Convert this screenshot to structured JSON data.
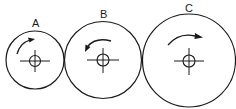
{
  "diagram": {
    "type": "gear-train",
    "gears": [
      {
        "id": "A",
        "label": "A",
        "cx": 35,
        "cy": 60,
        "r": 29,
        "rotation": "clockwise"
      },
      {
        "id": "B",
        "label": "B",
        "cx": 103,
        "cy": 60,
        "r": 39,
        "rotation": "counterclockwise"
      },
      {
        "id": "C",
        "label": "C",
        "cx": 189,
        "cy": 60,
        "r": 47,
        "rotation": "clockwise"
      }
    ],
    "colors": {
      "stroke": "#1a1a1a",
      "background": "#ffffff"
    }
  }
}
